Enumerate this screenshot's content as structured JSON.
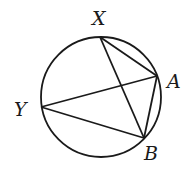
{
  "diagram": {
    "type": "inscribed-quadrilateral-circle",
    "circle": {
      "cx": 101,
      "cy": 97,
      "r": 60
    },
    "points": {
      "X": {
        "x": 100,
        "y": 37,
        "label": "X",
        "lx": 92,
        "ly": 25
      },
      "A": {
        "x": 157,
        "y": 76,
        "label": "A",
        "lx": 167,
        "ly": 88
      },
      "Y": {
        "x": 41,
        "y": 107,
        "label": "Y",
        "lx": 14,
        "ly": 116
      },
      "B": {
        "x": 144,
        "y": 138,
        "label": "B",
        "lx": 144,
        "ly": 160
      }
    },
    "segments": [
      [
        "X",
        "A"
      ],
      [
        "X",
        "B"
      ],
      [
        "A",
        "B"
      ],
      [
        "Y",
        "A"
      ],
      [
        "Y",
        "B"
      ]
    ],
    "colors": {
      "stroke": "#1a1a1a",
      "background": "#ffffff"
    }
  }
}
